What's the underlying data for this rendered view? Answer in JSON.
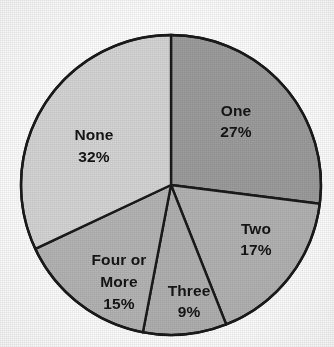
{
  "chart_data": {
    "type": "pie",
    "title": "",
    "subtitle": "",
    "xlabel": "",
    "ylabel": "",
    "legend_position": "none",
    "grid": false,
    "start_angle_deg": 0,
    "direction": "clockwise",
    "categories": [
      "One",
      "Two",
      "Three",
      "Four or More",
      "None"
    ],
    "values": [
      27,
      17,
      9,
      15,
      32
    ],
    "value_unit": "%",
    "slices": [
      {
        "label": "One",
        "value": 27,
        "value_label": "27%",
        "color": "#9c9c9c",
        "sweep_deg": 97.2,
        "label_lines": [
          "One",
          "27%"
        ]
      },
      {
        "label": "Two",
        "value": 17,
        "value_label": "17%",
        "color": "#b2b2b2",
        "sweep_deg": 61.2,
        "label_lines": [
          "Two",
          "17%"
        ]
      },
      {
        "label": "Three",
        "value": 9,
        "value_label": "9%",
        "color": "#b0b0b0",
        "sweep_deg": 32.4,
        "label_lines": [
          "Three",
          "9%"
        ]
      },
      {
        "label": "Four or More",
        "value": 15,
        "value_label": "15%",
        "color": "#b4b4b4",
        "sweep_deg": 54.0,
        "label_lines": [
          "Four or",
          "More",
          "15%"
        ]
      },
      {
        "label": "None",
        "value": 32,
        "value_label": "32%",
        "color": "#d4d4d4",
        "sweep_deg": 115.2,
        "label_lines": [
          "None",
          "32%"
        ]
      }
    ],
    "total": 100,
    "border_color": "#1a1a1a",
    "background_color": "#fdfdfd"
  },
  "labels": {
    "one_name": "One",
    "one_pct": "27%",
    "two_name": "Two",
    "two_pct": "17%",
    "three_name": "Three",
    "three_pct": "9%",
    "four_name_line1": "Four or",
    "four_name_line2": "More",
    "four_pct": "15%",
    "none_name": "None",
    "none_pct": "32%"
  }
}
